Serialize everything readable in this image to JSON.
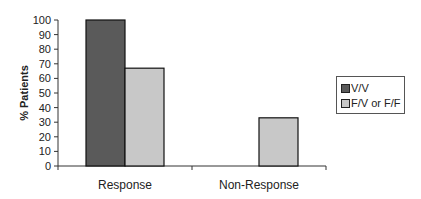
{
  "chart_data": {
    "type": "bar",
    "title": "",
    "xlabel": "",
    "ylabel": "% Patients",
    "ylim": [
      0,
      100
    ],
    "yticks": [
      0,
      10,
      20,
      30,
      40,
      50,
      60,
      70,
      80,
      90,
      100
    ],
    "categories": [
      "Response",
      "Non-Response"
    ],
    "series": [
      {
        "name": "V/V",
        "color": "#5a5a5a",
        "values": [
          100,
          0
        ]
      },
      {
        "name": "F/V or F/F",
        "color": "#c8c8c8",
        "values": [
          67,
          33
        ]
      }
    ],
    "grid": false,
    "legend_position": "right"
  }
}
